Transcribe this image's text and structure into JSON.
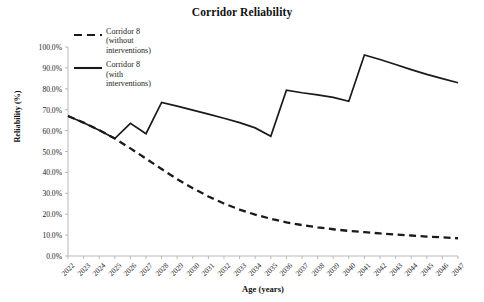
{
  "chart_data": {
    "type": "line",
    "title": "Corridor Reliability",
    "xlabel": "Age (years)",
    "ylabel": "Reliability (%)",
    "xlim": [
      2022,
      2047
    ],
    "ylim": [
      0,
      100
    ],
    "grid": false,
    "legend_position": "top-left-inside",
    "x": [
      2022,
      2023,
      2024,
      2025,
      2026,
      2027,
      2028,
      2029,
      2030,
      2031,
      2032,
      2033,
      2034,
      2035,
      2036,
      2037,
      2038,
      2039,
      2040,
      2041,
      2042,
      2043,
      2044,
      2045,
      2046,
      2047
    ],
    "xtick_labels": [
      "2022",
      "2023",
      "2024",
      "2025",
      "2026",
      "2027",
      "2028",
      "2029",
      "2030",
      "2031",
      "2032",
      "2033",
      "2034",
      "2035",
      "2036",
      "2037",
      "2038",
      "2039",
      "2040",
      "2041",
      "2042",
      "2043",
      "2044",
      "2045",
      "2046",
      "2047"
    ],
    "ytick_labels": [
      "0.0%",
      "10.0%",
      "20.0%",
      "30.0%",
      "40.0%",
      "50.0%",
      "60.0%",
      "70.0%",
      "80.0%",
      "90.0%",
      "100.0%"
    ],
    "ytick_values": [
      0,
      10,
      20,
      30,
      40,
      50,
      60,
      70,
      80,
      90,
      100
    ],
    "series": [
      {
        "name": "Corridor 8 (without interventions)",
        "legend_label": "Corridor 8\n(without\ninterventions)",
        "style": "dashed",
        "color": "#1a1a1a",
        "values": [
          67.0,
          63.8,
          60.2,
          56.2,
          51.5,
          46.6,
          41.6,
          36.8,
          32.4,
          28.5,
          25.1,
          22.2,
          19.8,
          17.8,
          16.1,
          14.8,
          13.7,
          12.8,
          12.0,
          11.4,
          10.8,
          10.3,
          9.8,
          9.3,
          8.9,
          8.5
        ]
      },
      {
        "name": "Corridor 8 (with interventions)",
        "legend_label": "Corridor 8\n(with\ninterventions)",
        "style": "solid",
        "color": "#1a1a1a",
        "values": [
          67.0,
          63.8,
          60.2,
          56.2,
          63.5,
          58.5,
          73.5,
          71.7,
          69.8,
          67.9,
          65.9,
          63.8,
          61.3,
          57.3,
          79.3,
          78.1,
          77.1,
          75.9,
          74.0,
          96.2,
          94.0,
          91.6,
          89.2,
          86.9,
          84.9,
          82.9
        ]
      }
    ],
    "interventions": [
      {
        "year": 2026,
        "from": 56.2,
        "to": 63.5
      },
      {
        "year": 2028,
        "from": 58.5,
        "to": 73.5
      },
      {
        "year": 2036,
        "from": 57.3,
        "to": 79.3
      },
      {
        "year": 2041,
        "from": 74.0,
        "to": 96.2
      }
    ]
  },
  "legend": {
    "entries": [
      {
        "label": "Corridor 8\n(without\ninterventions)",
        "style": "dashed"
      },
      {
        "label": "Corridor 8\n(with\ninterventions)",
        "style": "solid"
      }
    ]
  }
}
